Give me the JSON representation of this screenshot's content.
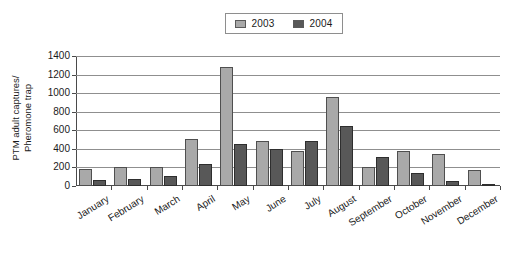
{
  "chart_data": {
    "type": "bar",
    "title": "",
    "subtitle": "",
    "xlabel": "",
    "ylabel": "PTM adult captures/ Pheromone trap",
    "ylabel_line1": "PTM adult captures/",
    "ylabel_line2": "Pheromone trap",
    "ylim": [
      0,
      1400
    ],
    "yticks": [
      0,
      200,
      400,
      600,
      800,
      1000,
      1200,
      1400
    ],
    "ytick_labels": [
      "0",
      "200",
      "400",
      "600",
      "800",
      "1000",
      "1200",
      "1400"
    ],
    "grid": true,
    "grid_axis": "y",
    "legend_position": "top-center",
    "categories": [
      "January",
      "February",
      "March",
      "April",
      "May",
      "June",
      "July",
      "August",
      "September",
      "October",
      "November",
      "December"
    ],
    "series": [
      {
        "name": "2003",
        "color": "#a9a9a9",
        "values": [
          180,
          210,
          210,
          505,
          1280,
          480,
          375,
          960,
          205,
          375,
          350,
          175
        ]
      },
      {
        "name": "2004",
        "color": "#585858",
        "values": [
          65,
          75,
          110,
          240,
          450,
          395,
          480,
          650,
          310,
          140,
          50,
          20
        ]
      }
    ]
  },
  "legend": {
    "entries": [
      {
        "label": "2003",
        "color": "#a9a9a9"
      },
      {
        "label": "2004",
        "color": "#585858"
      }
    ]
  },
  "colors": {
    "series_2003": "#a9a9a9",
    "series_2004": "#585858",
    "axis": "#4a4a4a",
    "gridline": "#8f8f8f",
    "background": "#ffffff",
    "text": "#1a1a1a"
  }
}
